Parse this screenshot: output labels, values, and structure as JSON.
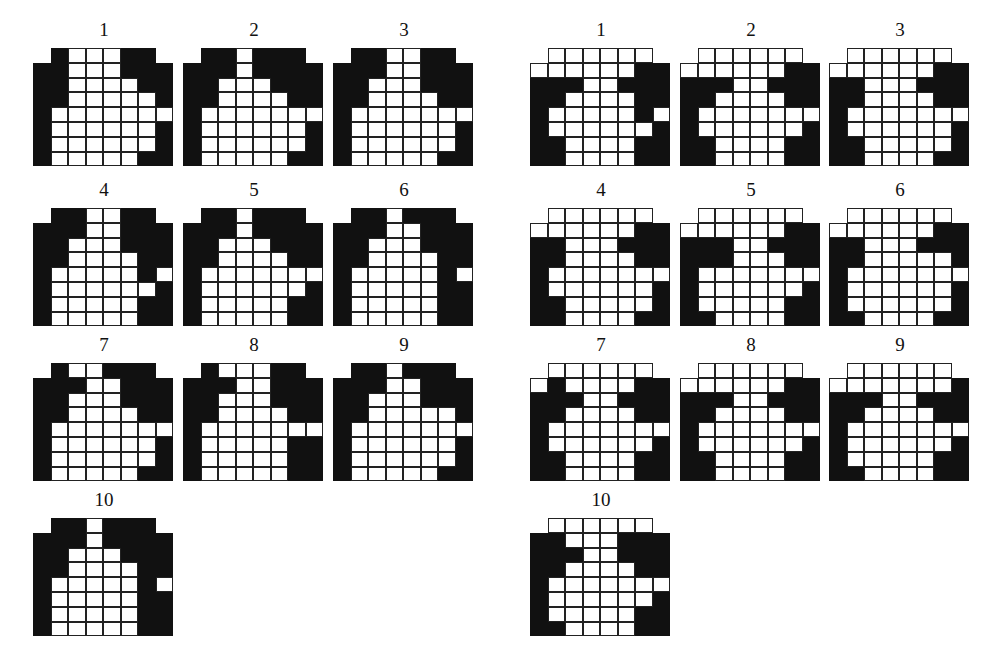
{
  "colors": {
    "filled": "#111111",
    "empty": "#ffffff",
    "line": "#222222"
  },
  "grid_layout": {
    "cols": 8,
    "rows": 8,
    "top_row_cols": [
      1,
      6
    ]
  },
  "left_set": {
    "panels": [
      {
        "label": "1",
        "rows": [
          "BWWWBB",
          "BBWWWBBB",
          "BBWWWWBB",
          "BBWWWWWB",
          "BWWWWWWW",
          "BWWWWWWB",
          "BWWWWWWB",
          "BWWWWWBB"
        ]
      },
      {
        "label": "2",
        "rows": [
          "BBWBBB",
          "BBBWBBBB",
          "BBWWWBBB",
          "BBWWWWBB",
          "BWWWWWWW",
          "BWWWWWWB",
          "BWWWWWWB",
          "BWWWWWBB"
        ]
      },
      {
        "label": "3",
        "rows": [
          "BBWWBB",
          "BBBWWBBB",
          "BBWWWBBB",
          "BBWWWWBB",
          "BWWWWWWW",
          "BWWWWWWB",
          "BWWWWWWB",
          "BWWWWWBB"
        ]
      },
      {
        "label": "4",
        "rows": [
          "BBWWBB",
          "BBBWWBBB",
          "BBWWWBBB",
          "BBWWWWBB",
          "BWWWWWBW",
          "BWWWWWWB",
          "BWWWWWBB",
          "BWWWWWBB"
        ]
      },
      {
        "label": "5",
        "rows": [
          "BBWBBB",
          "BBBWBBBB",
          "BBWWWBBB",
          "BBWWWWBB",
          "BWWWWWWW",
          "BWWWWWWB",
          "BWWWWWBB",
          "BWWWWWBB"
        ]
      },
      {
        "label": "6",
        "rows": [
          "BBWBBB",
          "BBBWWBBB",
          "BBWWWBBB",
          "BBWWWWBB",
          "BWWWWWBW",
          "BWWWWWBB",
          "BWWWWWBB",
          "BWWWWWBB"
        ]
      },
      {
        "label": "7",
        "rows": [
          "BWWBBB",
          "BBBWWBBB",
          "BBWWWBBB",
          "BBWWWWBB",
          "BWWWWWWW",
          "BWWWWWWB",
          "BWWWWWWB",
          "BWWWWWBB"
        ]
      },
      {
        "label": "8",
        "rows": [
          "BWWWBB",
          "BBBWWBBB",
          "BBWWWBBB",
          "BBWWWWBB",
          "BWWWWWWW",
          "BWWWWWBB",
          "BWWWWWBB",
          "BWWWWWBB"
        ]
      },
      {
        "label": "9",
        "rows": [
          "BBWBBB",
          "BBBWWBBB",
          "BBWWWBBB",
          "BBWWWWWB",
          "BWWWWWWW",
          "BWWWWWWB",
          "BWWWWWWB",
          "BWWWWWBB"
        ]
      },
      {
        "label": "10",
        "rows": [
          "BBWBBB",
          "BBBWBBBB",
          "BBWWWBBB",
          "BBWWWWBB",
          "BWWWWWBW",
          "BWWWWWBB",
          "BWWWWWBB",
          "BWWWWWBB"
        ]
      }
    ]
  },
  "right_set": {
    "panels": [
      {
        "label": "1",
        "rows": [
          "WWWWWW",
          "WWWWWWBB",
          "BBBWWBBB",
          "BBWWWWBB",
          "BWWWWWBW",
          "BWWWWWWB",
          "BBWWWWBB",
          "BBWWWWBB"
        ]
      },
      {
        "label": "2",
        "rows": [
          "WWWWWW",
          "WWWWWWBB",
          "BBBWWBBB",
          "BBWWWWBB",
          "BWWWWWWW",
          "BWWWWWWB",
          "BBWWWWBB",
          "BBWWWWBB"
        ]
      },
      {
        "label": "3",
        "rows": [
          "WWWWWW",
          "WWWWWWBB",
          "BBWWWBBB",
          "BBWWWWBB",
          "BWWWWWWW",
          "BWWWWWWB",
          "BBWWWWWB",
          "BBWWWWBB"
        ]
      },
      {
        "label": "4",
        "rows": [
          "WWWWWW",
          "WWWWWWBB",
          "BBWWWBBB",
          "BBWWWWBB",
          "BWWWWWWW",
          "BWWWWWWB",
          "BBWWWWWB",
          "BBWWWWBB"
        ]
      },
      {
        "label": "5",
        "rows": [
          "WWWWWW",
          "WWWWWWBB",
          "BBBWWBBB",
          "BBBWWWBB",
          "BWWWWWWW",
          "BWWWWWWB",
          "BWWWWWBB",
          "BBWWWWBB"
        ]
      },
      {
        "label": "6",
        "rows": [
          "WWWWWW",
          "WWWWWWBB",
          "BBWWWBBB",
          "BBWWWWWB",
          "BWWWWWWW",
          "BWWWWWWB",
          "BWWWWWWB",
          "BBWWWWBB"
        ]
      },
      {
        "label": "7",
        "rows": [
          "WWWWWW",
          "WBWWWWBB",
          "BBBWWBBB",
          "BBWWWWBB",
          "BWWWWWWW",
          "BWWWWWWB",
          "BBWWWWBB",
          "BBWWWWBB"
        ]
      },
      {
        "label": "8",
        "rows": [
          "WWWWWW",
          "WWWWWWBB",
          "BBBWWBBB",
          "BBWWWWBB",
          "BWWWWWWW",
          "BWWWWWWB",
          "BBWWWWBB",
          "BBWWWWBB"
        ]
      },
      {
        "label": "9",
        "rows": [
          "WWWWWW",
          "WWWWWWWB",
          "BBBWWBBB",
          "BBWWWWBB",
          "BWWWWWWW",
          "BWWWWWWB",
          "BWWWWWBB",
          "BBWWWWBB"
        ]
      },
      {
        "label": "10",
        "rows": [
          "WWWWWW",
          "BBWWWBBB",
          "BBBWWBBB",
          "BBWWWWBB",
          "BWWWWWWW",
          "BWWWWWWB",
          "BWWWWWBB",
          "BBWWWWBB"
        ]
      }
    ]
  }
}
